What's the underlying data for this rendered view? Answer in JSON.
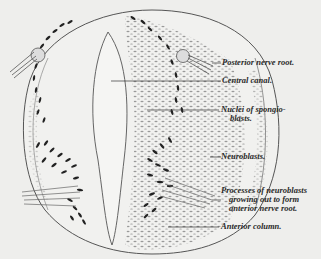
{
  "figure": {
    "colors": {
      "background": "#eeeeec",
      "ink": "#2a2a2a",
      "outline": "#555555",
      "stipple": "#8a8a8a"
    }
  },
  "labels": [
    {
      "id": "posterior-nerve-root",
      "text": "Posterior nerve root."
    },
    {
      "id": "central-canal",
      "text": "Central canal."
    },
    {
      "id": "nuclei-spongioblasts-1",
      "text": "Nuclei of spongio-"
    },
    {
      "id": "nuclei-spongioblasts-2",
      "text": "blasts."
    },
    {
      "id": "neuroblasts",
      "text": "Neuroblasts."
    },
    {
      "id": "processes-1",
      "text": "Processes of neuroblasts"
    },
    {
      "id": "processes-2",
      "text": "growing out to form"
    },
    {
      "id": "processes-3",
      "text": "anterior nerve root."
    },
    {
      "id": "anterior-column",
      "text": "Anterior column."
    }
  ]
}
